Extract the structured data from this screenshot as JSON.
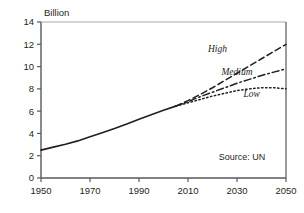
{
  "chart_data": {
    "type": "line",
    "title": "",
    "subtitle": "",
    "xlabel": "",
    "ylabel": "Billion",
    "xlim": [
      1950,
      2050
    ],
    "ylim": [
      0,
      14
    ],
    "xticks": [
      1950,
      1970,
      1990,
      2010,
      2030,
      2050
    ],
    "yticks": [
      0,
      2,
      4,
      6,
      8,
      10,
      12,
      14
    ],
    "xtick_labels": [
      "1950",
      "1970",
      "1990",
      "2010",
      "2030",
      "2050"
    ],
    "ytick_labels": [
      "0",
      "2",
      "4",
      "6",
      "8",
      "10",
      "12",
      "14"
    ],
    "grid": false,
    "legend_position": "inline-annotations",
    "annotations": [
      {
        "text": "Source: UN",
        "x": 2032,
        "y": 1.6,
        "name": "source-annotation"
      }
    ],
    "series": [
      {
        "name": "Estimates",
        "style": "solid",
        "label": "",
        "x": [
          1950,
          1955,
          1960,
          1965,
          1970,
          1975,
          1980,
          1985,
          1990,
          1995,
          2000,
          2005
        ],
        "values": [
          2.5,
          2.77,
          3.03,
          3.33,
          3.7,
          4.07,
          4.44,
          4.84,
          5.27,
          5.68,
          6.07,
          6.45
        ]
      },
      {
        "name": "High",
        "style": "dashed",
        "label": "High",
        "label_x": 2022,
        "label_y": 11.3,
        "x": [
          2005,
          2010,
          2015,
          2020,
          2025,
          2030,
          2035,
          2040,
          2045,
          2050
        ],
        "values": [
          6.45,
          6.95,
          7.5,
          8.1,
          8.75,
          9.4,
          10.05,
          10.7,
          11.35,
          12.0
        ]
      },
      {
        "name": "Medium",
        "style": "dashdot",
        "label": "Medium",
        "label_x": 2030,
        "label_y": 9.2,
        "x": [
          2005,
          2010,
          2015,
          2020,
          2025,
          2030,
          2035,
          2040,
          2045,
          2050
        ],
        "values": [
          6.45,
          6.85,
          7.3,
          7.7,
          8.1,
          8.5,
          8.85,
          9.2,
          9.5,
          9.8
        ]
      },
      {
        "name": "Low",
        "style": "dotted",
        "label": "Low",
        "label_x": 2036,
        "label_y": 7.3,
        "x": [
          2005,
          2010,
          2015,
          2020,
          2025,
          2030,
          2035,
          2040,
          2045,
          2050
        ],
        "values": [
          6.45,
          6.75,
          7.05,
          7.35,
          7.6,
          7.85,
          8.0,
          8.1,
          8.1,
          8.0
        ]
      }
    ],
    "colors": {
      "line": "#231f20",
      "axis": "#58595b",
      "text": "#231f20"
    }
  }
}
